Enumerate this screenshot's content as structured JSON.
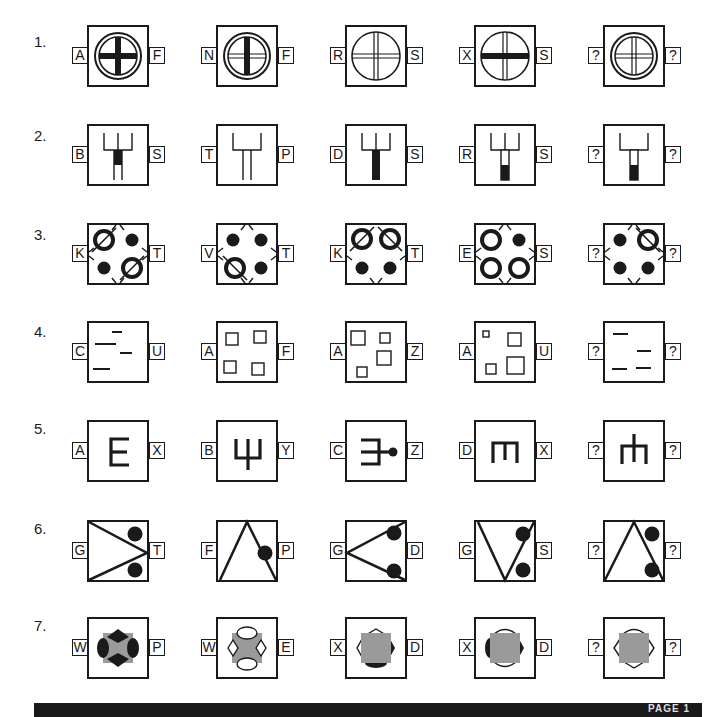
{
  "page": {
    "footer_text": "PAGE 1"
  },
  "questions": [
    {
      "number": "1.",
      "items": [
        {
          "left": "A",
          "right": "F",
          "figure": "circle-double-ring thick-vertical thick-horizontal"
        },
        {
          "left": "N",
          "right": "F",
          "figure": "circle-double-ring thick-vertical double-horizontal"
        },
        {
          "left": "R",
          "right": "S",
          "figure": "circle-single-ring double-vertical double-horizontal"
        },
        {
          "left": "X",
          "right": "S",
          "figure": "circle-single-ring double-vertical thick-horizontal"
        },
        {
          "left": "?",
          "right": "?",
          "figure": "circle-double-ring double-vertical double-horizontal"
        }
      ]
    },
    {
      "number": "2.",
      "items": [
        {
          "left": "B",
          "right": "S",
          "figure": "three-prong fork, short stem with black middle band"
        },
        {
          "left": "T",
          "right": "P",
          "figure": "two-prong fork, long open stem"
        },
        {
          "left": "D",
          "right": "S",
          "figure": "three-prong fork, long fully black stem"
        },
        {
          "left": "R",
          "right": "S",
          "figure": "three-prong fork, stem half white half black"
        },
        {
          "left": "?",
          "right": "?",
          "figure": "two-prong fork, stem half white half black"
        }
      ]
    },
    {
      "number": "3.",
      "items": [
        {
          "left": "K",
          "right": "T",
          "figure": "rings top-left & bottom-right slashed, dots top-right & bottom-left"
        },
        {
          "left": "V",
          "right": "T",
          "figure": "ring bottom-left backslashed, three dots"
        },
        {
          "left": "K",
          "right": "T",
          "figure": "rings top-left slashed & top-right backslashed, dots bottom"
        },
        {
          "left": "E",
          "right": "S",
          "figure": "three plain rings, dot top-right"
        },
        {
          "left": "?",
          "right": "?",
          "figure": "ring top-right backslashed, three dots"
        }
      ]
    },
    {
      "number": "4.",
      "items": [
        {
          "left": "C",
          "right": "U",
          "figure": "four dashes"
        },
        {
          "left": "A",
          "right": "F",
          "figure": "four equal squares"
        },
        {
          "left": "A",
          "right": "Z",
          "figure": "four squares of two sizes"
        },
        {
          "left": "A",
          "right": "U",
          "figure": "four squares of three sizes"
        },
        {
          "left": "?",
          "right": "?",
          "figure": "four dashes"
        }
      ]
    },
    {
      "number": "5.",
      "items": [
        {
          "left": "A",
          "right": "X",
          "figure": "E shape"
        },
        {
          "left": "B",
          "right": "Y",
          "figure": "trident upward with stem"
        },
        {
          "left": "C",
          "right": "Z",
          "figure": "trident rightward with ball end"
        },
        {
          "left": "D",
          "right": "X",
          "figure": "upside-down E / m shape"
        },
        {
          "left": "?",
          "right": "?",
          "figure": "m shape with center stem up"
        }
      ]
    },
    {
      "number": "6.",
      "items": [
        {
          "left": "G",
          "right": "T",
          "figure": "> wedge pointing right with two dots"
        },
        {
          "left": "F",
          "right": "P",
          "figure": "triangle apex up with dot on right edge"
        },
        {
          "left": "G",
          "right": "D",
          "figure": "< wedge pointing left with two dots on edges"
        },
        {
          "left": "G",
          "right": "S",
          "figure": "V shape with two dots"
        },
        {
          "left": "?",
          "right": "?",
          "figure": "triangle apex up with two dots"
        }
      ]
    },
    {
      "number": "7.",
      "items": [
        {
          "left": "W",
          "right": "P",
          "figure": "grey square, black diamonds top/bottom, black ovals left/right"
        },
        {
          "left": "W",
          "right": "E",
          "figure": "grey square, white ovals top/bottom, white diamonds left/right"
        },
        {
          "left": "X",
          "right": "D",
          "figure": "grey square, white chevron top, black cap bottom, white/black sides"
        },
        {
          "left": "X",
          "right": "D",
          "figure": "grey square, white arcs top/bottom, black half-ovals sides"
        },
        {
          "left": "?",
          "right": "?",
          "figure": "grey square, white chevrons all four sides"
        }
      ]
    }
  ],
  "colors": {
    "ink": "#1a1a1a",
    "grey_fill": "#9a9a9a",
    "paper": "#ffffff"
  }
}
